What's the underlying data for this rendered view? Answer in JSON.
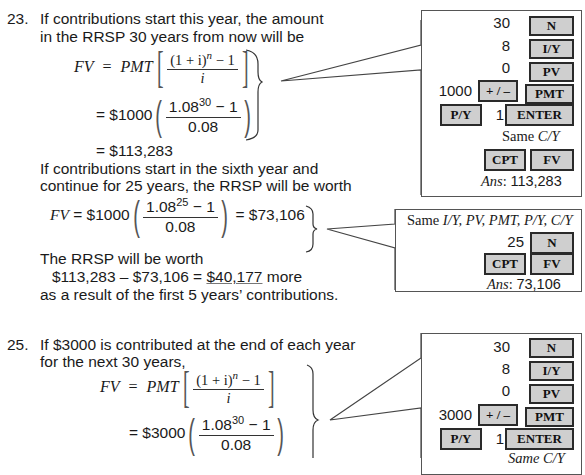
{
  "problem23": {
    "number": "23.",
    "line1": "If contributions start this year, the amount",
    "line2": "in the RRSP 30 years from now will be",
    "formula": {
      "lhs": "FV",
      "eq": "=",
      "pmt": "PMT",
      "num": "(1 + i)",
      "num_exp": "n",
      "num_tail": " − 1",
      "den": "i"
    },
    "step1": {
      "eq": "= $1000",
      "num_base": "1.08",
      "num_exp": "30",
      "num_tail": " − 1",
      "den": "0.08"
    },
    "step2": "= $113,283",
    "line3": "If contributions start in the sixth year and",
    "line4": "continue for 25 years, the RRSP will be worth",
    "fv25": {
      "lhs": "FV",
      "eq": " = $1000",
      "num_base": "1.08",
      "num_exp": "25",
      "num_tail": " − 1",
      "den": "0.08",
      "result": "= $73,106"
    },
    "line5": "The RRSP will be worth",
    "diff": {
      "expr": "$113,283 – $73,106 = ",
      "answer": "$40,177",
      "tail": " more"
    },
    "line6": "as a result of the first 5 years’ contributions."
  },
  "calc23a": {
    "rows": [
      {
        "value": "30",
        "key": "N"
      },
      {
        "value": "8",
        "key": "I/Y"
      },
      {
        "value": "0",
        "key": "PV"
      },
      {
        "value": "1000",
        "key": "+ / –",
        "key2": "PMT"
      }
    ],
    "py_key": "P/Y",
    "py_value": "1",
    "enter_key": "ENTER",
    "same_label": "Same ",
    "same_vars": "C/Y",
    "cpt_key": "CPT",
    "fv_key": "FV",
    "ans_label": "Ans",
    "ans_value": "113,283"
  },
  "calc23b": {
    "same_label": "Same ",
    "same_vars": "I/Y, PV, PMT, P/Y, C/Y",
    "n_value": "25",
    "n_key": "N",
    "cpt_key": "CPT",
    "fv_key": "FV",
    "ans_label": "Ans",
    "ans_value": "73,106"
  },
  "problem25": {
    "number": "25.",
    "line1": "If $3000 is contributed at the end of each year",
    "line2": "for the next 30 years,",
    "formula": {
      "lhs": "FV",
      "eq": "=",
      "pmt": "PMT",
      "num": "(1 + i)",
      "num_exp": "n",
      "num_tail": " − 1",
      "den": "i"
    },
    "step1": {
      "eq": "= $3000",
      "num_base": "1.08",
      "num_exp": "30",
      "num_tail": " − 1",
      "den": "0.08"
    }
  },
  "calc25": {
    "rows": [
      {
        "value": "30",
        "key": "N"
      },
      {
        "value": "8",
        "key": "I/Y"
      },
      {
        "value": "0",
        "key": "PV"
      },
      {
        "value": "3000",
        "key": "+ / –",
        "key2": "PMT"
      }
    ],
    "py_key": "P/Y",
    "py_value": "1",
    "enter_key": "ENTER",
    "same_partial": "Same C/Y"
  }
}
